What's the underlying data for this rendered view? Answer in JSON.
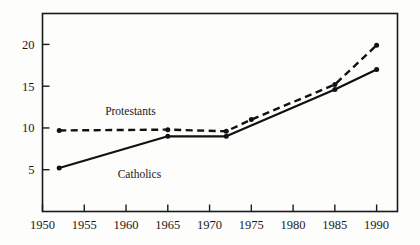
{
  "chart_data": {
    "type": "line",
    "title": "",
    "subtitle": "",
    "xlabel": "",
    "ylabel": "",
    "xlim": [
      1950,
      1992.5
    ],
    "ylim": [
      0,
      23.7
    ],
    "grid": false,
    "legend_position": "inline-annotations",
    "frame": "box",
    "xticks": [
      1950,
      1955,
      1960,
      1965,
      1970,
      1975,
      1980,
      1985,
      1990
    ],
    "xtick_labels": [
      "1950",
      "1955",
      "1960",
      "1965",
      "1970",
      "1975",
      "1980",
      "1985",
      "1990"
    ],
    "yticks": [
      5,
      10,
      15,
      20
    ],
    "ytick_labels": [
      "5",
      "10",
      "15",
      "20"
    ],
    "series": [
      {
        "name": "Protestants",
        "style": "dashed",
        "color": "#111111",
        "marker": "circle",
        "x": [
          1952,
          1965,
          1972,
          1975,
          1985,
          1990
        ],
        "values": [
          9.7,
          9.8,
          9.6,
          11.0,
          15.2,
          19.9
        ],
        "label_x": 1957.5,
        "label_y": 11.5
      },
      {
        "name": "Catholics",
        "style": "solid",
        "color": "#111111",
        "marker": "circle",
        "x": [
          1952,
          1965,
          1972,
          1985,
          1990
        ],
        "values": [
          5.2,
          9.0,
          9.0,
          14.6,
          17.0
        ],
        "label_x": 1959.0,
        "label_y": 4.0
      }
    ],
    "annotations": [
      {
        "text": "Protestants",
        "x": 1957.5,
        "y": 11.5
      },
      {
        "text": "Catholics",
        "x": 1959.0,
        "y": 4.0
      }
    ]
  }
}
